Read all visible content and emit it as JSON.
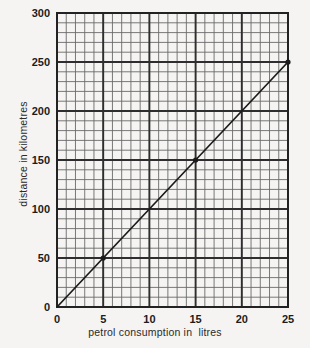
{
  "chart_data": {
    "type": "line",
    "title": "",
    "xlabel": "petrol consumption in  litres",
    "ylabel": "distance in kilometres",
    "xlim": [
      0,
      25
    ],
    "ylim": [
      0,
      300
    ],
    "xticks": [
      0,
      5,
      10,
      15,
      20,
      25
    ],
    "yticks": [
      0,
      50,
      100,
      150,
      200,
      250,
      300
    ],
    "xtick_labels": [
      "0",
      "5",
      "10",
      "15",
      "20",
      "25"
    ],
    "ytick_labels": [
      "0",
      "50",
      "100",
      "150",
      "200",
      "250",
      "300"
    ],
    "x_minor_step": 1,
    "y_minor_step": 10,
    "grid": true,
    "legend": "none",
    "series": [
      {
        "name": "distance vs petrol consumption",
        "x": [
          0,
          25
        ],
        "y": [
          0,
          250
        ],
        "slope_km_per_litre": 10,
        "color": "#1a1a1a",
        "markers": [
          {
            "x": 5,
            "y": 50
          },
          {
            "x": 15,
            "y": 150
          },
          {
            "x": 25,
            "y": 250
          }
        ]
      }
    ]
  },
  "figure": {
    "background_color": "#f5f4f2",
    "grid_color": "#2e2e2e",
    "minor_grid_color": "#6a6a6a",
    "line_color": "#1a1a1a"
  }
}
